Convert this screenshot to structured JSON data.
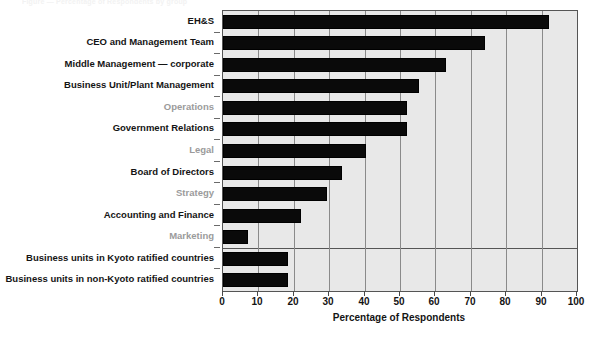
{
  "figure": {
    "top_caption": "Figure — Percentage of Respondents by group",
    "background_color": "#ffffff",
    "plot_background_color": "#e8e8e8",
    "bar_color": "#0a0a0a",
    "grid_color": "#8a8a8a",
    "muted_label_color": "#9b9b9b"
  },
  "chart_data": {
    "type": "bar",
    "orientation": "horizontal",
    "title": "",
    "xlabel": "Percentage of Respondents",
    "ylabel": "",
    "xlim": [
      0,
      100
    ],
    "xticks": [
      0,
      10,
      20,
      30,
      40,
      50,
      60,
      70,
      80,
      90,
      100
    ],
    "xtick_labels": [
      "0",
      "10",
      "20",
      "30",
      "40",
      "50",
      "60",
      "70",
      "80",
      "90",
      "100"
    ],
    "grid": true,
    "grid_axis": "x",
    "legend": null,
    "categories": [
      "EH&S",
      "CEO and Management Team",
      "Middle Management — corporate",
      "Business Unit/Plant Management",
      "Operations",
      "Government Relations",
      "Legal",
      "Board of Directors",
      "Strategy",
      "Accounting and Finance",
      "Marketing",
      "Business units in Kyoto ratified countries",
      "Business units in non-Kyoto ratified countries"
    ],
    "values": [
      92,
      74,
      63,
      55.5,
      52,
      52,
      40.5,
      33.5,
      29.5,
      22,
      7,
      18.5,
      18.5
    ],
    "label_emphasis": [
      "bold",
      "bold",
      "bold",
      "bold",
      "muted",
      "bold",
      "muted",
      "bold",
      "muted",
      "bold",
      "muted",
      "bold",
      "bold"
    ],
    "group_separator_after_index": 10,
    "annotations": []
  }
}
